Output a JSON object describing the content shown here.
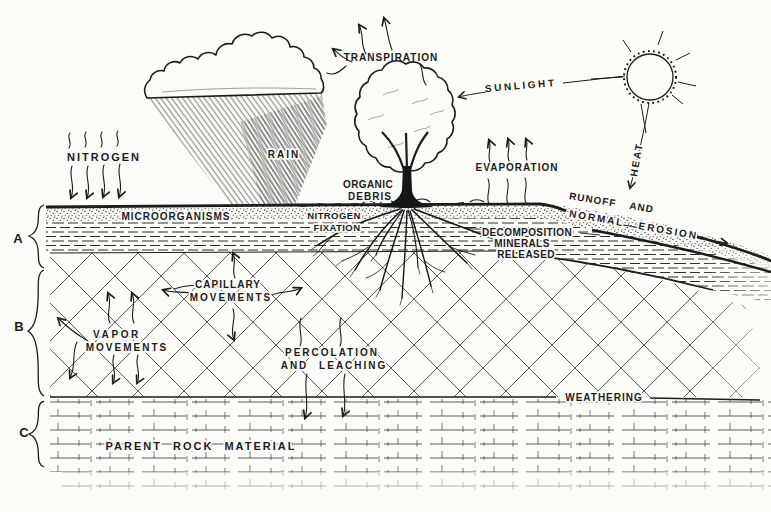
{
  "colors": {
    "paper": "#fbfbf8",
    "ink": "#1c1c1c"
  },
  "sky": {
    "nitrogen": "NITROGEN",
    "rain": "RAIN",
    "transpiration": "TRANSPIRATION",
    "sunlight": "SUNLIGHT",
    "heat": "HEAT",
    "evaporation": "EVAPORATION",
    "organic_debris": [
      "ORGANIC",
      "DEBRIS"
    ],
    "runoff": [
      "RUNOFF AND",
      "NORMAL EROSION"
    ]
  },
  "horizons": {
    "a": {
      "letter": "A",
      "microorganisms": "MICROORGANISMS",
      "nitrogen_fixation": [
        "NITROGEN",
        "FIXATION"
      ],
      "decomposition": [
        "DECOMPOSITION",
        "MINERALS",
        "RELEASED"
      ]
    },
    "b": {
      "letter": "B",
      "capillary": [
        "CAPILLARY",
        "MOVEMENTS"
      ],
      "vapor": [
        "VAPOR",
        "MOVEMENTS"
      ],
      "percolation": [
        "PERCOLATION",
        "AND LEACHING"
      ],
      "weathering": "WEATHERING"
    },
    "c": {
      "letter": "C",
      "parent_rock": "PARENT ROCK MATERIAL"
    }
  }
}
